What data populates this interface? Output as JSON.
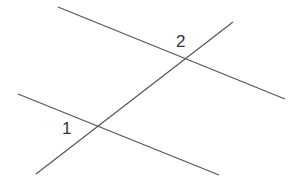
{
  "diagram": {
    "line_color": "#555555",
    "label_color": "#333333",
    "lines": [
      {
        "name": "upper-line",
        "x1": 58,
        "y1": 7,
        "x2": 285,
        "y2": 99
      },
      {
        "name": "lower-line",
        "x1": 18,
        "y1": 94,
        "x2": 219,
        "y2": 175
      },
      {
        "name": "transversal",
        "x1": 36,
        "y1": 174,
        "x2": 233,
        "y2": 22
      }
    ],
    "labels": [
      {
        "name": "angle-2",
        "text": "2",
        "x": 176,
        "y": 33
      },
      {
        "name": "angle-1",
        "text": "1",
        "x": 62,
        "y": 120
      }
    ]
  }
}
